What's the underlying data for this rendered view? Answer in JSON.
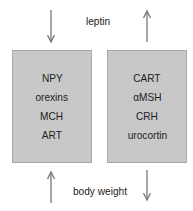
{
  "top_label": "leptin",
  "bottom_label": "body weight",
  "left_box": {
    "items": [
      "NPY",
      "orexins",
      "MCH",
      "ART"
    ]
  },
  "right_box": {
    "items": [
      "CART",
      "αMSH",
      "CRH",
      "urocortin"
    ]
  },
  "arrows": {
    "top_left": "down",
    "top_right": "up",
    "bottom_left": "up",
    "bottom_right": "down"
  },
  "colors": {
    "box_fill": "#c8c8c8",
    "arrow": "#777777"
  }
}
